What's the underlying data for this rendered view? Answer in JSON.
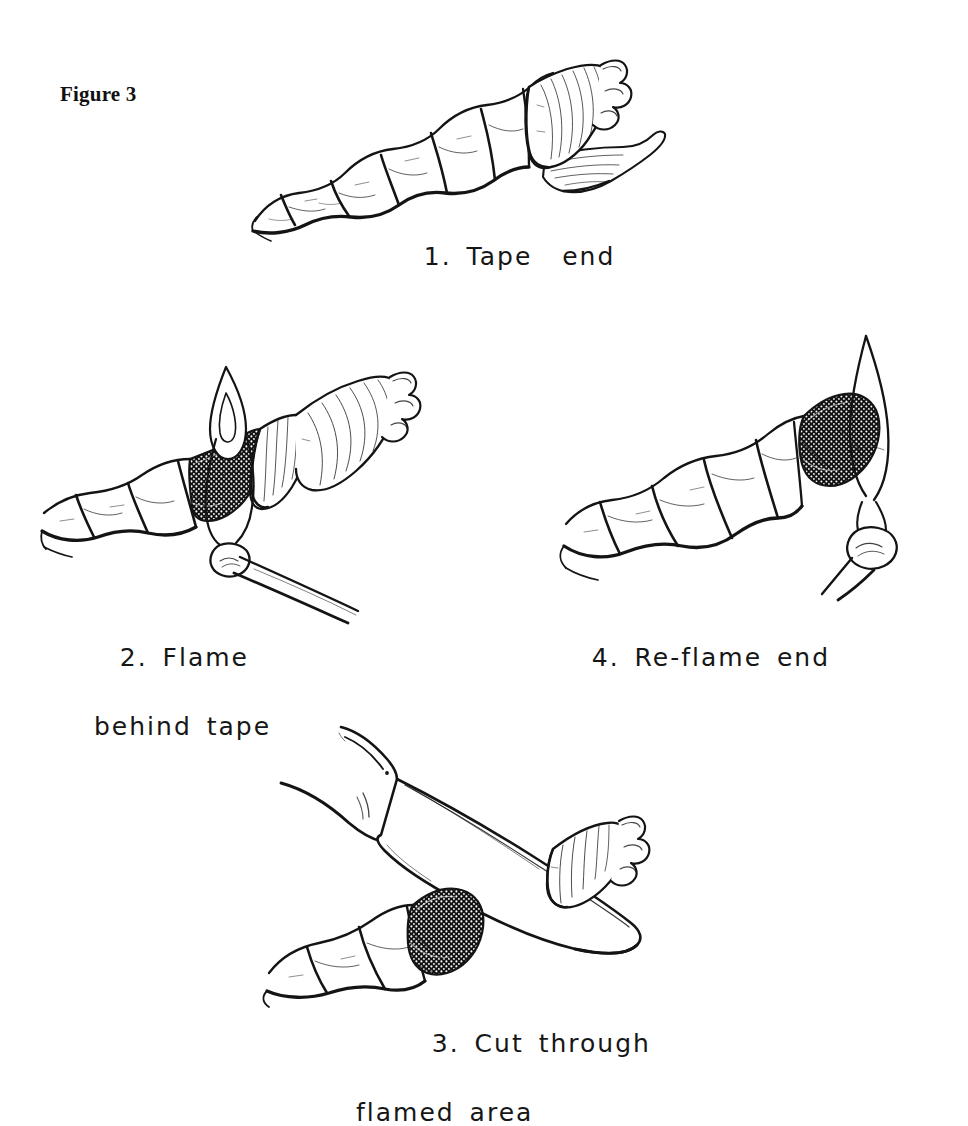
{
  "figure": {
    "title": "Figure 3",
    "background_color": "#ffffff",
    "ink_color": "#141414",
    "medium": "pen-and-ink line drawing"
  },
  "panels": [
    {
      "number": "1",
      "caption_line_1": "1. Tape  end",
      "caption_line_2": "",
      "elements": [
        "three-strand-rope",
        "tape-wrap",
        "tape-tail",
        "frayed-rope-tip"
      ],
      "description": "Rope running lower-left to upper-right with adhesive tape wrapped around the end and a loose tape tail hanging to the right"
    },
    {
      "number": "2",
      "caption_line_1": "2. Flame",
      "caption_line_2": "behind tape",
      "elements": [
        "three-strand-rope",
        "tape-wrap",
        "match",
        "match-flame",
        "melted-stipple-band"
      ],
      "description": "Match flame held against the rope just behind the tape wrap, melting a dark stippled band into the strands"
    },
    {
      "number": "3",
      "caption_line_1": "3. Cut through",
      "caption_line_2": "flamed area",
      "elements": [
        "knife-blade",
        "knife-handle",
        "three-strand-rope",
        "tape-wrap",
        "melted-stipple-band"
      ],
      "description": "A knife blade cutting straight through the blackened melted area, separating the taped end from the rope"
    },
    {
      "number": "4",
      "caption_line_1": "4. Re-flame end",
      "caption_line_2": "",
      "elements": [
        "three-strand-rope",
        "match",
        "match-flame",
        "melted-stipple-end"
      ],
      "description": "The freshly cut rope end re-melted with a match flame to seal the fibres"
    }
  ],
  "captions": {
    "panel_1": {
      "line1": "1. Tape  end",
      "line2": ""
    },
    "panel_2": {
      "line1": "2. Flame",
      "line2": "behind tape"
    },
    "panel_3": {
      "line1": "3. Cut through",
      "line2": "flamed area"
    },
    "panel_4": {
      "line1": "4. Re-flame end",
      "line2": ""
    }
  }
}
